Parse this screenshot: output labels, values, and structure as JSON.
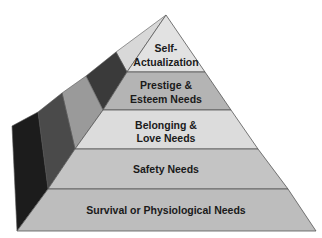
{
  "diagram": {
    "type": "pyramid",
    "levels": [
      {
        "line1": "Self-",
        "line2": "Actualization",
        "fill": "#e2e2e2"
      },
      {
        "line1": "Prestige &",
        "line2": "Esteem Needs",
        "fill": "#b4b4b4"
      },
      {
        "line1": "Belonging &",
        "line2": "Love Needs",
        "fill": "#dcdcdc"
      },
      {
        "line1": "Safety Needs",
        "line2": "",
        "fill": "#c4c4c4"
      },
      {
        "line1": "Survival or Physiological Needs",
        "line2": "",
        "fill": "#bdbdbd"
      }
    ],
    "side_strips": [
      "#d8d8d8",
      "#3a3a3a",
      "#9a9a9a",
      "#4a4a4a",
      "#1c1c1c"
    ],
    "edge_color": "#555555"
  }
}
